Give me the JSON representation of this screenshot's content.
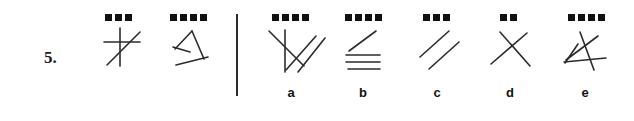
{
  "exercise": {
    "number_label": "5.",
    "divider_present": true
  },
  "prompt_figures": [
    {
      "id": "prompt-figure-1",
      "dot_count": 3,
      "line_count": 3,
      "description": "vertical line, horizontal line and one diagonal crossing",
      "lines": [
        {
          "x1": 18,
          "y1": 2,
          "x2": 18,
          "y2": 40
        },
        {
          "x1": 2,
          "y1": 16,
          "x2": 38,
          "y2": 16
        },
        {
          "x1": 5,
          "y1": 39,
          "x2": 38,
          "y2": 6
        }
      ]
    },
    {
      "id": "prompt-figure-2",
      "dot_count": 4,
      "line_count": 4,
      "description": "four-like angular shape with short crossbar and long base",
      "lines": [
        {
          "x1": 3,
          "y1": 20,
          "x2": 20,
          "y2": 2
        },
        {
          "x1": 20,
          "y1": 2,
          "x2": 32,
          "y2": 30
        },
        {
          "x1": 1,
          "y1": 18,
          "x2": 18,
          "y2": 23
        },
        {
          "x1": 4,
          "y1": 36,
          "x2": 36,
          "y2": 28
        }
      ]
    }
  ],
  "options": [
    {
      "letter": "a",
      "dot_count": 4,
      "line_count": 4,
      "description": "vertical line with three parallel diagonals crossing it",
      "lines": [
        {
          "x1": 17,
          "y1": 2,
          "x2": 17,
          "y2": 44
        },
        {
          "x1": 1,
          "y1": 3,
          "x2": 36,
          "y2": 38
        },
        {
          "x1": 18,
          "y1": 42,
          "x2": 48,
          "y2": 8
        },
        {
          "x1": 30,
          "y1": 44,
          "x2": 57,
          "y2": 10
        }
      ]
    },
    {
      "letter": "b",
      "dot_count": 4,
      "line_count": 4,
      "description": "one diagonal above three horizontal parallel lines",
      "lines": [
        {
          "x1": 3,
          "y1": 22,
          "x2": 30,
          "y2": 2
        },
        {
          "x1": 0,
          "y1": 26,
          "x2": 34,
          "y2": 26
        },
        {
          "x1": 0,
          "y1": 33,
          "x2": 34,
          "y2": 33
        },
        {
          "x1": 2,
          "y1": 40,
          "x2": 34,
          "y2": 40
        }
      ]
    },
    {
      "letter": "c",
      "dot_count": 3,
      "line_count": 2,
      "description": "two parallel diagonal lines",
      "lines": [
        {
          "x1": 1,
          "y1": 28,
          "x2": 30,
          "y2": 2
        },
        {
          "x1": 10,
          "y1": 40,
          "x2": 40,
          "y2": 13
        }
      ]
    },
    {
      "letter": "d",
      "dot_count": 2,
      "line_count": 2,
      "description": "two diagonals crossing in an X",
      "lines": [
        {
          "x1": 1,
          "y1": 34,
          "x2": 37,
          "y2": 3
        },
        {
          "x1": 10,
          "y1": 2,
          "x2": 40,
          "y2": 36
        }
      ]
    },
    {
      "letter": "e",
      "dot_count": 4,
      "line_count": 4,
      "description": "four lines crossing in a star-like tangle",
      "lines": [
        {
          "x1": 16,
          "y1": 2,
          "x2": 30,
          "y2": 40
        },
        {
          "x1": 2,
          "y1": 30,
          "x2": 34,
          "y2": 6
        },
        {
          "x1": 1,
          "y1": 33,
          "x2": 14,
          "y2": 14
        },
        {
          "x1": 0,
          "y1": 32,
          "x2": 42,
          "y2": 28
        }
      ]
    }
  ],
  "colors": {
    "ink": "#111111",
    "stroke": "#2b2b2b",
    "background": "#ffffff"
  }
}
